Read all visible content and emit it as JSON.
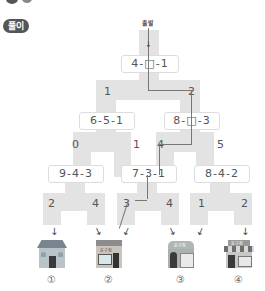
{
  "header": {
    "badge_label": "풀이",
    "start_label": "출발"
  },
  "tree": {
    "level0": {
      "expression": "4-□-1",
      "answer_hidden": true
    },
    "level1_numbers": [
      "1",
      "2"
    ],
    "level1": [
      {
        "expression": "6-5-1"
      },
      {
        "expression": "8-□-3"
      }
    ],
    "level2_numbers": [
      "0",
      "1",
      "4",
      "5"
    ],
    "level2": [
      {
        "expression": "9-4-3"
      },
      {
        "expression": "7-3-1"
      },
      {
        "expression": "8-4-2"
      }
    ],
    "level3_numbers": [
      "2",
      "4",
      "3",
      "4",
      "1",
      "2"
    ]
  },
  "shops": [
    {
      "label": "①",
      "sign": ""
    },
    {
      "label": "②",
      "sign": "문구점"
    },
    {
      "label": "③",
      "sign": "문구점"
    },
    {
      "label": "④",
      "sign": "문구점"
    }
  ],
  "path_color": "#777777",
  "region_color": "#e3e3e3"
}
